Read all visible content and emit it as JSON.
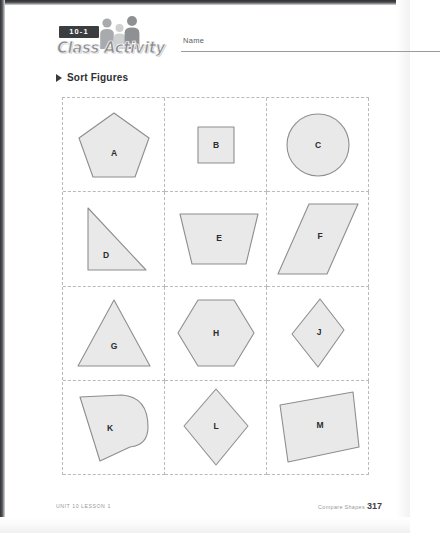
{
  "header": {
    "lesson_badge": "10-1",
    "logo_text": "Class Activity",
    "name_label": "Name",
    "people_icon": "three-people-silhouette-icon"
  },
  "section": {
    "bullet_icon": "triangle-right-icon",
    "title": "Sort Figures"
  },
  "grid": {
    "columns": 3,
    "rows": 4,
    "shapes": [
      {
        "label": "A",
        "figure": "pentagon"
      },
      {
        "label": "B",
        "figure": "square"
      },
      {
        "label": "C",
        "figure": "circle"
      },
      {
        "label": "D",
        "figure": "right-triangle"
      },
      {
        "label": "E",
        "figure": "trapezoid"
      },
      {
        "label": "F",
        "figure": "parallelogram"
      },
      {
        "label": "G",
        "figure": "triangle"
      },
      {
        "label": "H",
        "figure": "hexagon"
      },
      {
        "label": "J",
        "figure": "rhombus"
      },
      {
        "label": "K",
        "figure": "curved-side-polygon"
      },
      {
        "label": "L",
        "figure": "kite"
      },
      {
        "label": "M",
        "figure": "tilted-square"
      }
    ]
  },
  "footer": {
    "left": "UNIT 10 LESSON 1",
    "right_label": "Compare Shapes",
    "page_number": "317"
  },
  "colors": {
    "shape_fill": "#e9e9e9",
    "shape_stroke": "#8d8e91",
    "grid_line": "#b9babd",
    "badge_bg": "#3c3d40",
    "text": "#2e2f32"
  }
}
